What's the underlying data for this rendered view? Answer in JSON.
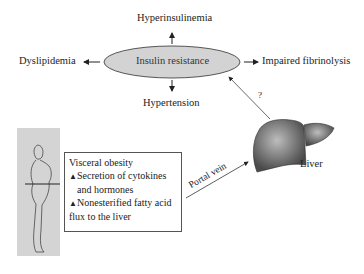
{
  "diagram": {
    "center": {
      "label": "Insulin resistance",
      "fill": "#d3d3d3"
    },
    "effects": {
      "top": "Hyperinsulinemia",
      "left": "Dyslipidemia",
      "right": "Impaired fibrinolysis",
      "bottom": "Hypertension"
    },
    "liver_link_label": "?",
    "liver_label": "Liver",
    "portal_label": "Portal vein",
    "box": {
      "title": "Visceral obesity",
      "item1_line1": "Secretion of cytokines",
      "item1_line2": "and hormones",
      "item2_line1": "Nonesterified fatty acid",
      "item2_line2": "flux to the liver",
      "arrow_glyph": "▲"
    }
  }
}
